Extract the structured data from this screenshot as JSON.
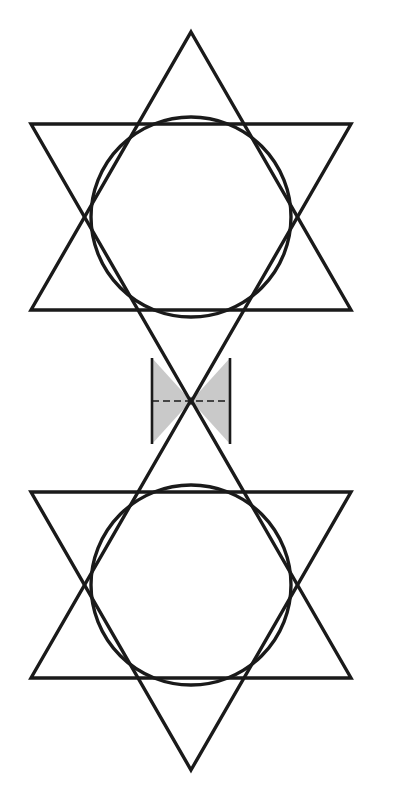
{
  "canvas": {
    "width": 396,
    "height": 800,
    "background_color": "#FFFFFF"
  },
  "style": {
    "stroke_color": "#1A1A1A",
    "stroke_width_outer": 3.4,
    "stroke_width_inner": 2.6,
    "stroke_width_circle": 3.4,
    "fill_shaded": "#C9C9C9",
    "fill_none": "none",
    "dash_stroke_width": 1.3,
    "dash_pattern": "7,4"
  },
  "components": {
    "upper_star": {
      "name": "upper-hexagram",
      "center": [
        191,
        217
      ],
      "circumradius": 185,
      "up_triangle_vertices": "191,32 351,310 31,310",
      "down_triangle_vertices": "191,402 31,124 351,124",
      "inner_hexagon_vertices": "191,124 271,124 351,217 271,310 111,310 31,217 111,124"
    },
    "upper_circle": {
      "name": "upper-inscribed-circle",
      "center": [
        191,
        217
      ],
      "radius": 100
    },
    "lower_star": {
      "name": "lower-hexagram",
      "center": [
        191,
        585
      ],
      "circumradius": 185,
      "down_triangle_vertices": "191,770 351,492 31,492",
      "up_triangle_vertices": "191,400 31,678 351,678",
      "inner_hexagon_vertices": "191,678 271,678 351,585 271,492 111,492 31,585 111,678"
    },
    "lower_circle": {
      "name": "lower-inscribed-circle",
      "center": [
        191,
        585
      ],
      "radius": 100
    },
    "connector_band": {
      "name": "connector-rectangle",
      "left": 152,
      "right": 230,
      "top": 358,
      "bottom": 444,
      "width": 78,
      "height": 86
    },
    "shaded_left_sector": {
      "name": "left-shaded-triangle",
      "vertices": "152,358 191,401 152,444",
      "fill": "#C9C9C9"
    },
    "shaded_right_sector": {
      "name": "right-shaded-triangle",
      "vertices": "230,358 191,401 230,444",
      "fill": "#C9C9C9"
    },
    "crossing_point": {
      "name": "diagonal-crossing-point",
      "x": 191,
      "y": 401
    },
    "dashed_axis": {
      "name": "horizontal-dashed-axis",
      "x1": 152,
      "y1": 401,
      "x2": 230,
      "y2": 401
    }
  },
  "labels": {
    "none_visible": ""
  }
}
